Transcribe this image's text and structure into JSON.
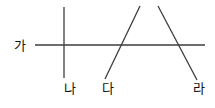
{
  "figure": {
    "canvas": {
      "width": 215,
      "height": 108,
      "background": "#ffffff"
    },
    "stroke_color": "#3d3d3d",
    "text_color": "#111111",
    "stroke_width": 1.3,
    "lines": [
      {
        "id": "line-ga",
        "label": "가",
        "orientation": "horizontal",
        "x1": 35,
        "y1": 45,
        "x2": 205,
        "y2": 45
      },
      {
        "id": "line-na",
        "label": "나",
        "orientation": "vertical",
        "x1": 64,
        "y1": 7,
        "x2": 64,
        "y2": 78
      },
      {
        "id": "line-da",
        "label": "다",
        "orientation": "diagonal-rising",
        "x1": 105,
        "y1": 79,
        "x2": 140,
        "y2": 6
      },
      {
        "id": "line-ra",
        "label": "라",
        "orientation": "diagonal-falling",
        "x1": 158,
        "y1": 6,
        "x2": 197,
        "y2": 80
      }
    ],
    "labels": {
      "ga": "가",
      "na": "나",
      "da": "다",
      "ra": "라"
    },
    "label_positions": {
      "ga": {
        "x": 14,
        "y": 45
      },
      "na": {
        "x": 70,
        "y": 82
      },
      "da": {
        "x": 108,
        "y": 82
      },
      "ra": {
        "x": 199,
        "y": 82
      }
    }
  }
}
